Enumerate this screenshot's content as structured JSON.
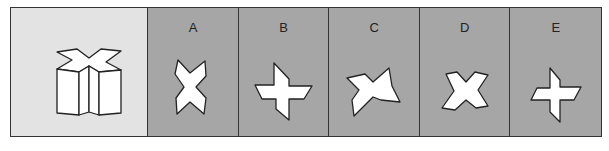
{
  "puzzle": {
    "question": {
      "shape": "3d-x-prism"
    },
    "options": [
      {
        "label": "A",
        "shape": "vertical-x-star"
      },
      {
        "label": "B",
        "shape": "skewed-cross"
      },
      {
        "label": "C",
        "shape": "tilted-x-star"
      },
      {
        "label": "D",
        "shape": "horizontal-x-star"
      },
      {
        "label": "E",
        "shape": "skewed-cross-small"
      }
    ]
  },
  "colors": {
    "question_bg": "#e3e3e3",
    "option_bg": "#a6a6a6",
    "shape_fill": "#ffffff",
    "stroke": "#222222"
  }
}
